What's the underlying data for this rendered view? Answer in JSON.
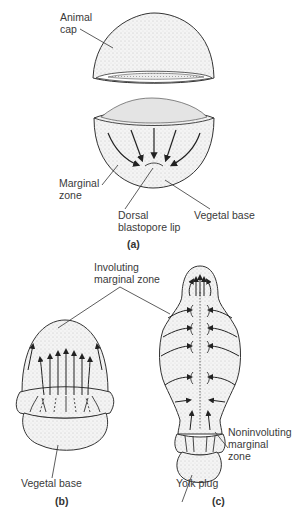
{
  "figure": {
    "panel_a": {
      "caption": "(a)",
      "labels": {
        "animal_cap": "Animal\ncap",
        "marginal_zone": "Marginal\nzone",
        "dorsal_blastopore_lip": "Dorsal\nblastopore lip",
        "vegetal_base": "Vegetal base"
      }
    },
    "panel_b": {
      "caption": "(b)",
      "labels": {
        "vegetal_base": "Vegetal base"
      }
    },
    "panel_c": {
      "caption": "(c)",
      "labels": {
        "yolk_plug": "Yolk plug",
        "noninvoluting_marginal_zone": "Noninvoluting\nmarginal\nzone"
      }
    },
    "shared_labels": {
      "involuting_marginal_zone": "Involuting\nmarginal zone"
    },
    "colors": {
      "line": "#333333",
      "fill": "#f2f2f2",
      "stipple": "#9a9a9a"
    }
  }
}
